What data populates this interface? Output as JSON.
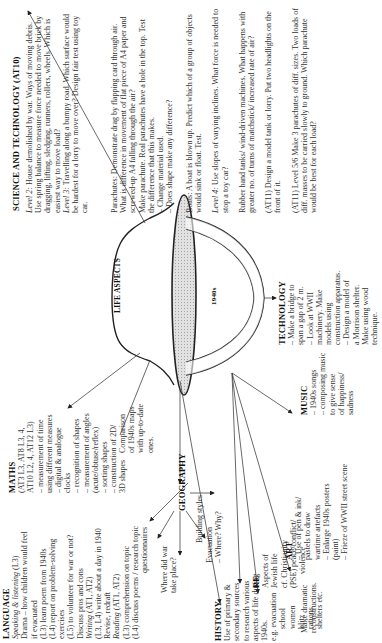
{
  "center": {
    "top_label": "LIFE ASPECTS",
    "inner_label": "1940s"
  },
  "science": {
    "heading": "SCIENCE AND TECHNOLOGY (AT10)",
    "col1": [
      {
        "lead": "Level 2:",
        "text": " House demolished by war. Ways of moving debris. Use spring balance to measure force needed to move brick by dragging, lifting, sledging, runners, rollers, wheels. Which is easiest way to move load?"
      },
      {
        "lead": "Level 3:",
        "text": " Travelling along a bumpy road. Which surface would be hardest for a lorry to move over? Design fair test using toy car."
      }
    ],
    "col2": [
      "Parachutes: Demonstrate drag by flapping card through air. What is difference in movement of flat piece of A4 paper and screwed-up A4 falling through the air?",
      "Make parachute. Real parachutes have a hole in the top. Test the difference that this makes.",
      "– Change material used.",
      "– Does shape make any difference?"
    ],
    "col3": [
      "Boats: A boat is blown up. Predict which of a group of objects would sink or float. Test.",
      {
        "lead": "Level 4:",
        "text": " Use slopes of varying inclines. What force is needed to stop a toy car?"
      },
      "Rubber band tanks/ wind-driven machines. What happens with greater no. of turns of matchstick/ increased rate of air?",
      "(AT11) Design a model tank or lorry. Put two headlights on the front of it.",
      "(AT11) Level 5/6 Make 3 parachutes of diff. sizes. Two loads of diff. masses to be carried slowly to ground. Which parachute would be best for each load?"
    ]
  },
  "technology": {
    "heading": "TECHNOLOGY",
    "lines": [
      "– Make a bridge to",
      "span a gap of 2 m.",
      "– Look at WWII",
      "machinery. Make",
      "models using",
      "construction apparatus.",
      "– Design a model of",
      "a Morrison shelter.",
      "Make using wood",
      "technique."
    ]
  },
  "music": {
    "heading": "MUSIC",
    "lines": [
      "– 1940s songs",
      "– composing music",
      "to give sense",
      "of happiness/",
      "sadness"
    ]
  },
  "maths": {
    "heading": "MATHS",
    "lines": [
      "(AT3 L3, AT8 L3, 4,",
      "AT10 L2, 4, AT12 L3)",
      "– measurement of time",
      "using different measures",
      "– digital & analogue",
      "clocks",
      "– recognition of shapes",
      "– measurement of angles",
      "(acute/obtuse/reflex)",
      "– sorting shapes",
      "– construction of 2D/",
      "3D shapes"
    ]
  },
  "language": {
    "heading": "LANGUAGE",
    "lines": [
      {
        "i": "Speaking & listening",
        "t": " (L3)"
      },
      {
        "t": "Drama – how children would feel"
      },
      {
        "t": "if evacuated"
      },
      {
        "t": "(L3) learn poem from 1940s"
      },
      {
        "t": "(L4) report on problem-solving"
      },
      {
        "t": "exercises"
      },
      {
        "t": "(L5) to volunteer for war or not?"
      },
      {
        "t": "Discuss pros and cons"
      },
      {
        "i": "Writing",
        "t": " (AT1, AT2)"
      },
      {
        "t": "(L3, L4) write about a day in 1940"
      },
      {
        "t": "Revise, redraft"
      },
      {
        "i": "Reading",
        "t": " (AT1, AT2)"
      },
      {
        "t": "(L3) comprehension on topic"
      },
      {
        "t": "(L4) discuss poems / research topic"
      }
    ]
  },
  "geography": {
    "heading": "GEOGRAPHY",
    "comparison": [
      "Comparison",
      "of 1940s maps",
      "with up-to-date",
      "ones."
    ],
    "building": "Building styles",
    "questionnaires": "questionnaires",
    "where": [
      "Where did war",
      "take place?"
    ],
    "evacuation": [
      "Evacuation",
      "– Where? Why?"
    ]
  },
  "history": {
    "heading": "HISTORY",
    "lines": [
      "Use of primary &",
      "secondary sources",
      "to research various",
      "aspects of life during",
      "1940s.",
      "e.g. evacuation",
      "school",
      "women",
      "blitz",
      "rations",
      "shelters etc."
    ]
  },
  "re": {
    "heading": "RE",
    "lines": [
      "Aspects of",
      "Jewish life",
      "cf. Christianity",
      "(PSE) peace/conflict/",
      "violence"
    ]
  },
  "drama": {
    "lines": [
      "Make dramatic",
      "reconstructions."
    ]
  },
  "art": {
    "heading": "ART",
    "lines": [
      "– Use of pen & ink/",
      "pastels to draw",
      "wartime artefacts",
      "– Enlarge 1940s posters",
      "(paint)",
      "– Frieze of WWII street scene"
    ]
  }
}
